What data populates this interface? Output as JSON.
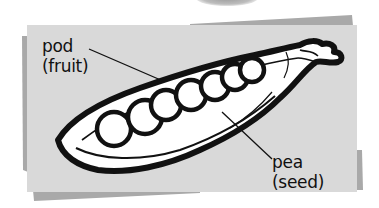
{
  "diagram": {
    "labels": [
      {
        "id": "pod",
        "line1": "pod",
        "line2": "(fruit)"
      },
      {
        "id": "pea",
        "line1": "pea",
        "line2": "(seed)"
      }
    ],
    "pea_count": 7
  },
  "colors": {
    "background": "#ffffff",
    "card": "#d9d9d9",
    "card_shadow": "#a9a9a9",
    "ink": "#111111",
    "pod_fill": "#ffffff"
  }
}
